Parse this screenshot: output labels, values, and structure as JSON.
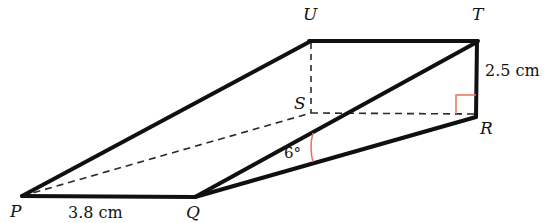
{
  "figure": {
    "type": "3d-geometry-diagram",
    "colors": {
      "stroke": "#101010",
      "dashed": "#2a2a2a",
      "angle_mark": "#e8715a",
      "text": "#141414",
      "background": "#ffffff"
    },
    "vertices": [
      {
        "name": "P",
        "label": "P",
        "x": 22,
        "y": 196,
        "label_x": 10,
        "label_y": 203
      },
      {
        "name": "Q",
        "label": "Q",
        "x": 195,
        "y": 197,
        "label_x": 186,
        "label_y": 204
      },
      {
        "name": "R",
        "label": "R",
        "x": 476,
        "y": 116,
        "label_x": 480,
        "label_y": 120
      },
      {
        "name": "S",
        "label": "S",
        "x": 311,
        "y": 113,
        "label_x": 294,
        "label_y": 95
      },
      {
        "name": "T",
        "label": "T",
        "x": 477,
        "y": 41,
        "label_x": 472,
        "label_y": 6
      },
      {
        "name": "U",
        "label": "U",
        "x": 311,
        "y": 41,
        "label_x": 303,
        "label_y": 6
      }
    ],
    "solid_edges": [
      {
        "name": "edge-P-Q",
        "from": "P",
        "to": "Q"
      },
      {
        "name": "edge-P-U",
        "from": "P",
        "to": "U"
      },
      {
        "name": "edge-U-T",
        "from": "U",
        "to": "T"
      },
      {
        "name": "edge-T-R",
        "from": "T",
        "to": "R"
      },
      {
        "name": "edge-Q-T",
        "from": "Q",
        "to": "T"
      },
      {
        "name": "edge-Q-R",
        "from": "Q",
        "to": "R"
      }
    ],
    "dashed_edges": [
      {
        "name": "edge-P-S",
        "from": "P",
        "to": "S"
      },
      {
        "name": "edge-S-R",
        "from": "S",
        "to": "R"
      },
      {
        "name": "edge-U-S",
        "from": "U",
        "to": "S"
      }
    ],
    "labels": {
      "base_length": "3.8 cm",
      "base_length_x": 68,
      "base_length_y": 205,
      "height": "2.5 cm",
      "height_x": 485,
      "height_y": 63,
      "angle": "6°",
      "angle_x": 284,
      "angle_y": 146
    },
    "marks": {
      "right_angle": {
        "name": "right-angle-mark",
        "x": 456,
        "y": 95,
        "size": 19
      },
      "angle_arc": {
        "name": "angle-arc-6deg",
        "x": 313,
        "y_top": 133,
        "y_bottom": 162
      }
    }
  }
}
